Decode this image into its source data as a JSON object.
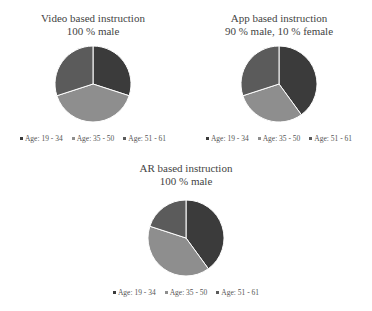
{
  "chart_data": [
    {
      "type": "pie",
      "title": "Video based instruction",
      "subtitle": "100 % male",
      "categories": [
        "Age: 19 - 34",
        "Age: 35 - 50",
        "Age: 51 - 61"
      ],
      "values": [
        30,
        40,
        30
      ],
      "colors": [
        "#3b3b3b",
        "#8e8e8e",
        "#5b5b5b"
      ],
      "legend_position": "bottom"
    },
    {
      "type": "pie",
      "title": "App based instruction",
      "subtitle": "90 % male, 10 % female",
      "categories": [
        "Age: 19 - 34",
        "Age: 35 - 50",
        "Age: 51 - 61"
      ],
      "values": [
        40,
        30,
        30
      ],
      "colors": [
        "#3b3b3b",
        "#8e8e8e",
        "#5b5b5b"
      ],
      "legend_position": "bottom"
    },
    {
      "type": "pie",
      "title": "AR based instruction",
      "subtitle": "100 % male",
      "categories": [
        "Age: 19 - 34",
        "Age: 35 - 50",
        "Age: 51 - 61"
      ],
      "values": [
        40,
        40,
        20
      ],
      "colors": [
        "#3b3b3b",
        "#8e8e8e",
        "#5b5b5b"
      ],
      "legend_position": "bottom"
    }
  ],
  "charts": [
    {
      "title": "Video based instruction",
      "subtitle": "100 % male",
      "legend": [
        "Age: 19 - 34",
        "Age: 35 - 50",
        "Age: 51 - 61"
      ]
    },
    {
      "title": "App based instruction",
      "subtitle": "90 % male, 10 % female",
      "legend": [
        "Age: 19 - 34",
        "Age: 35 - 50",
        "Age: 51 - 61"
      ]
    },
    {
      "title": "AR based instruction",
      "subtitle": "100 % male",
      "legend": [
        "Age: 19 - 34",
        "Age: 35 - 50",
        "Age: 51 - 61"
      ]
    }
  ]
}
